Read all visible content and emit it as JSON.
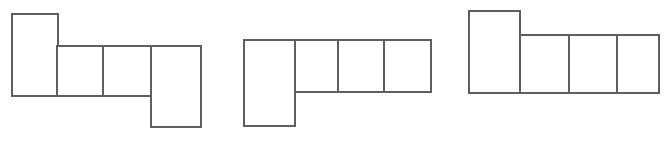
{
  "figure": {
    "title": "",
    "canvas": {
      "width": 664,
      "height": 142,
      "background": "#ffffff"
    },
    "stroke": {
      "color": "#5f5f5f",
      "width": 2,
      "join": "miter"
    },
    "fill": "#ffffff",
    "shapes": [
      {
        "id": "shape-1",
        "name": "net-left",
        "label": "",
        "cell_count": 4,
        "cells": [
          {
            "name": "cell-1-a",
            "x": 12,
            "y": 14,
            "w": 46,
            "h": 82
          },
          {
            "name": "cell-1-b",
            "x": 57,
            "y": 46,
            "w": 46,
            "h": 50
          },
          {
            "name": "cell-1-c",
            "x": 103,
            "y": 46,
            "w": 49,
            "h": 50
          },
          {
            "name": "cell-1-d",
            "x": 151,
            "y": 46,
            "w": 50,
            "h": 81
          }
        ]
      },
      {
        "id": "shape-2",
        "name": "net-middle",
        "label": "",
        "cell_count": 4,
        "cells": [
          {
            "name": "cell-2-a",
            "x": 244,
            "y": 40,
            "w": 51,
            "h": 86
          },
          {
            "name": "cell-2-b",
            "x": 295,
            "y": 40,
            "w": 43,
            "h": 52
          },
          {
            "name": "cell-2-c",
            "x": 338,
            "y": 40,
            "w": 46,
            "h": 52
          },
          {
            "name": "cell-2-d",
            "x": 384,
            "y": 40,
            "w": 47,
            "h": 52
          }
        ]
      },
      {
        "id": "shape-3",
        "name": "net-right",
        "label": "",
        "cell_count": 4,
        "cells": [
          {
            "name": "cell-3-a",
            "x": 469,
            "y": 11,
            "w": 51,
            "h": 82
          },
          {
            "name": "cell-3-b",
            "x": 520,
            "y": 35,
            "w": 49,
            "h": 58
          },
          {
            "name": "cell-3-c",
            "x": 569,
            "y": 35,
            "w": 48,
            "h": 58
          },
          {
            "name": "cell-3-d",
            "x": 617,
            "y": 35,
            "w": 42,
            "h": 58
          }
        ]
      }
    ]
  }
}
